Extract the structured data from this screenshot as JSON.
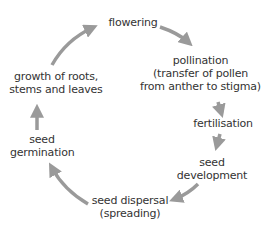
{
  "diagram": {
    "colors": {
      "text": "#333333",
      "arrow": "#9a9a9a",
      "background": "#ffffff"
    },
    "stages": [
      {
        "id": "flowering",
        "lines": [
          "flowering"
        ]
      },
      {
        "id": "pollination",
        "lines": [
          "pollination",
          "(transfer of pollen",
          "from anther to stigma)"
        ]
      },
      {
        "id": "fertilisation",
        "lines": [
          "fertilisation"
        ]
      },
      {
        "id": "seed-development",
        "lines": [
          "seed",
          "development"
        ]
      },
      {
        "id": "seed-dispersal",
        "lines": [
          "seed dispersal",
          "(spreading)"
        ]
      },
      {
        "id": "seed-germination",
        "lines": [
          "seed",
          "germination"
        ]
      },
      {
        "id": "growth",
        "lines": [
          "growth of roots,",
          "stems and leaves"
        ]
      }
    ],
    "arrows": [
      {
        "from": "flowering",
        "to": "pollination"
      },
      {
        "from": "pollination",
        "to": "fertilisation"
      },
      {
        "from": "fertilisation",
        "to": "seed-development"
      },
      {
        "from": "seed-development",
        "to": "seed-dispersal"
      },
      {
        "from": "seed-dispersal",
        "to": "seed-germination"
      },
      {
        "from": "seed-germination",
        "to": "growth"
      },
      {
        "from": "growth",
        "to": "flowering"
      }
    ]
  }
}
